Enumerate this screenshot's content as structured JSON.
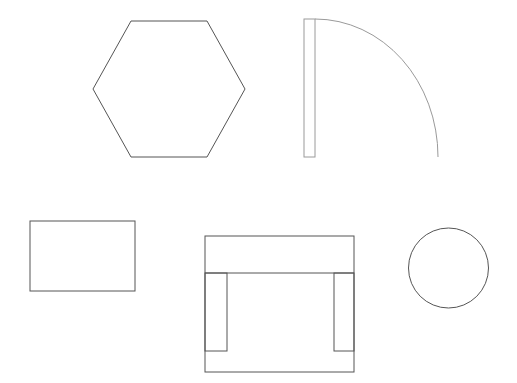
{
  "canvas": {
    "width": 517,
    "height": 383,
    "background": "#ffffff"
  },
  "colors": {
    "stroke_dark": "#555555",
    "stroke_light": "#9a9a9a"
  },
  "shapes": [
    {
      "name": "hexagon",
      "type": "polygon",
      "points": "131,21 207,21 245,89 207,157 131,157 93,89",
      "stroke": "#555555"
    },
    {
      "name": "door",
      "type": "door",
      "panel": {
        "x": 304,
        "y": 19,
        "width": 11,
        "height": 138
      },
      "arc": "M315,19 A123,138 0 0 1 438,157",
      "stroke": "#9a9a9a"
    },
    {
      "name": "rectangle",
      "type": "rect",
      "x": 30,
      "y": 221,
      "width": 105,
      "height": 70,
      "stroke": "#555555"
    },
    {
      "name": "sofa",
      "type": "sofa",
      "outer": {
        "x": 205,
        "y": 236,
        "width": 149,
        "height": 136
      },
      "back_line_y": 273,
      "left_arm": {
        "x": 205,
        "y": 273,
        "width": 22,
        "height": 78
      },
      "right_arm": {
        "x": 334,
        "y": 273,
        "width": 20,
        "height": 78
      },
      "stroke": "#555555"
    },
    {
      "name": "circle",
      "type": "circle",
      "cx": 448.5,
      "cy": 268,
      "r": 40,
      "stroke": "#555555"
    }
  ]
}
